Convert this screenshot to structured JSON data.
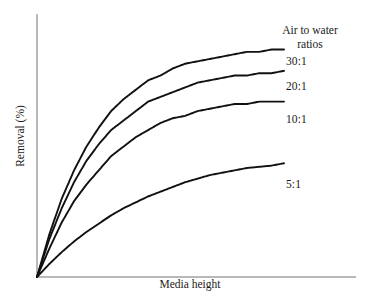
{
  "figure": {
    "background_color": "#ffffff",
    "curve_color": "#111111",
    "axis_color": "#b9b9b9"
  },
  "axes": {
    "xlabel": "Media height",
    "ylabel": "Removal (%)"
  },
  "legend": {
    "title_line1": "Air to water",
    "title_line2": "ratios"
  },
  "series_labels": {
    "s30": "30:1",
    "s20": "20:1",
    "s10": "10:1",
    "s5": "5:1"
  },
  "chart_data": {
    "type": "line",
    "title": "",
    "subtitle": "",
    "xlabel": "Media height",
    "ylabel": "Removal (%)",
    "xlim": [
      0,
      1
    ],
    "ylim": [
      0,
      1
    ],
    "grid": false,
    "axis_ticks": false,
    "legend_position": "right-inline-labels",
    "legend_title": "Air to water ratios",
    "annotations": [
      "Air to water ratios"
    ],
    "note": "Qualitative schematic: removal efficiency vs media height for four air-to-water ratios; all curves rise steeply from the origin and saturate. Axes are unlabeled (no numeric ticks); x and y are normalized 0-1.",
    "x": [
      0,
      0.05,
      0.1,
      0.15,
      0.2,
      0.25,
      0.3,
      0.35,
      0.4,
      0.45,
      0.5,
      0.55,
      0.6,
      0.65,
      0.7,
      0.75,
      0.8,
      0.85,
      0.9,
      0.95,
      1
    ],
    "series": [
      {
        "name": "30:1",
        "label": "30:1",
        "color": "#111111",
        "saturation": 0.97,
        "rate": 4.2,
        "values": [
          0,
          0.18,
          0.33,
          0.45,
          0.55,
          0.63,
          0.7,
          0.75,
          0.79,
          0.83,
          0.85,
          0.88,
          0.9,
          0.91,
          0.92,
          0.93,
          0.94,
          0.95,
          0.95,
          0.96,
          0.96
        ]
      },
      {
        "name": "20:1",
        "label": "20:1",
        "color": "#111111",
        "saturation": 0.87,
        "rate": 4.0,
        "values": [
          0,
          0.16,
          0.29,
          0.4,
          0.49,
          0.56,
          0.62,
          0.66,
          0.7,
          0.74,
          0.76,
          0.78,
          0.8,
          0.82,
          0.83,
          0.84,
          0.85,
          0.85,
          0.86,
          0.86,
          0.87
        ]
      },
      {
        "name": "10:1",
        "label": "10:1",
        "color": "#111111",
        "saturation": 0.74,
        "rate": 3.5,
        "values": [
          0,
          0.12,
          0.23,
          0.32,
          0.39,
          0.45,
          0.51,
          0.55,
          0.59,
          0.62,
          0.65,
          0.67,
          0.68,
          0.7,
          0.71,
          0.72,
          0.73,
          0.73,
          0.74,
          0.74,
          0.74
        ]
      },
      {
        "name": "5:1",
        "label": "5:1",
        "color": "#111111",
        "saturation": 0.48,
        "rate": 2.4,
        "values": [
          0,
          0.055,
          0.105,
          0.15,
          0.19,
          0.225,
          0.26,
          0.29,
          0.315,
          0.34,
          0.36,
          0.38,
          0.4,
          0.415,
          0.43,
          0.44,
          0.45,
          0.46,
          0.465,
          0.47,
          0.48
        ]
      }
    ]
  }
}
